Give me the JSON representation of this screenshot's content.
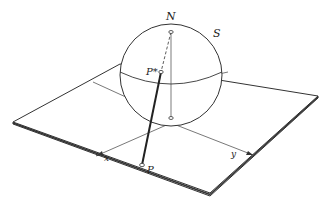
{
  "figure": {
    "labels": {
      "north_pole": "N",
      "sphere": "S",
      "point_on_sphere": "P*",
      "point_on_plane": "P",
      "x_axis": "x",
      "y_axis": "y"
    },
    "colors": {
      "stroke": "#333333",
      "background": "#ffffff"
    }
  }
}
